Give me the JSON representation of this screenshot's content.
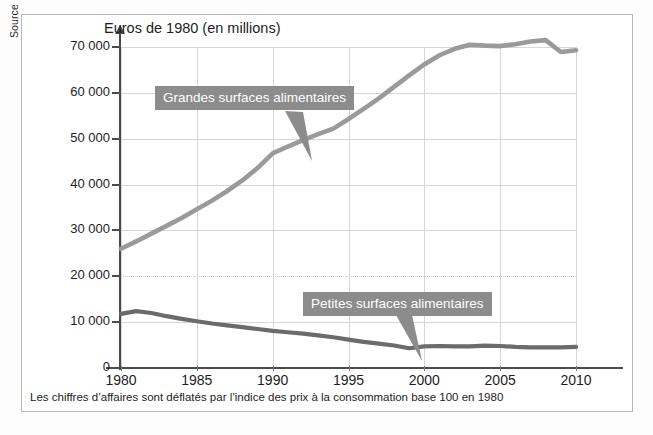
{
  "source_note": "Source : Insee, 2012.",
  "caption": "Les chiffres d’affaires sont déflatés par l’indice des prix à la consommation base 100 en 1980",
  "annotations": [
    {
      "label": "Grandes surfaces alimentaires"
    },
    {
      "label": "Petites surfaces alimentaires"
    }
  ],
  "colors": {
    "grandes_line": "#9a9a9a",
    "petites_line": "#6b6b6b",
    "callout_box": "#8c8c8c",
    "axis": "#4b4b4b",
    "grid": "#d6d6d6",
    "frame": "#b9b9b9"
  },
  "chart_data": {
    "type": "line",
    "title": "Euros de 1980 (en millions)",
    "xlabel": "",
    "ylabel": "Euros de 1980 (en millions)",
    "xlim": [
      1980,
      2010
    ],
    "ylim": [
      0,
      70000
    ],
    "grid": true,
    "legend_position": "inline-annotations",
    "ytick_labels": [
      "0",
      "10 000",
      "20 000",
      "30 000",
      "40 000",
      "50 000",
      "60 000",
      "70 000"
    ],
    "ytick_values": [
      0,
      10000,
      20000,
      30000,
      40000,
      50000,
      60000,
      70000
    ],
    "xtick_labels": [
      "1980",
      "1985",
      "1990",
      "1995",
      "2000",
      "2005",
      "2010"
    ],
    "xtick_values": [
      1980,
      1985,
      1990,
      1995,
      2000,
      2005,
      2010
    ],
    "x": [
      1980,
      1981,
      1982,
      1983,
      1984,
      1985,
      1986,
      1987,
      1988,
      1989,
      1990,
      1991,
      1992,
      1993,
      1994,
      1995,
      1996,
      1997,
      1998,
      1999,
      2000,
      2001,
      2002,
      2003,
      2004,
      2005,
      2006,
      2007,
      2008,
      2009,
      2010
    ],
    "series": [
      {
        "name": "Grandes surfaces alimentaires",
        "color": "#9a9a9a",
        "values": [
          26000,
          27600,
          29300,
          31000,
          32700,
          34600,
          36500,
          38600,
          40900,
          43600,
          46800,
          48300,
          49700,
          51000,
          52200,
          54300,
          56500,
          58800,
          61300,
          63800,
          66200,
          68200,
          69600,
          70500,
          70300,
          70200,
          70600,
          71200,
          71500,
          68900,
          69300
        ]
      },
      {
        "name": "Petites surfaces alimentaires",
        "color": "#6b6b6b",
        "values": [
          11800,
          12400,
          12000,
          11300,
          10700,
          10200,
          9700,
          9300,
          8900,
          8500,
          8100,
          7800,
          7500,
          7100,
          6700,
          6200,
          5700,
          5300,
          4900,
          4300,
          4700,
          4800,
          4700,
          4700,
          4900,
          4800,
          4600,
          4500,
          4500,
          4500,
          4600
        ]
      }
    ]
  }
}
